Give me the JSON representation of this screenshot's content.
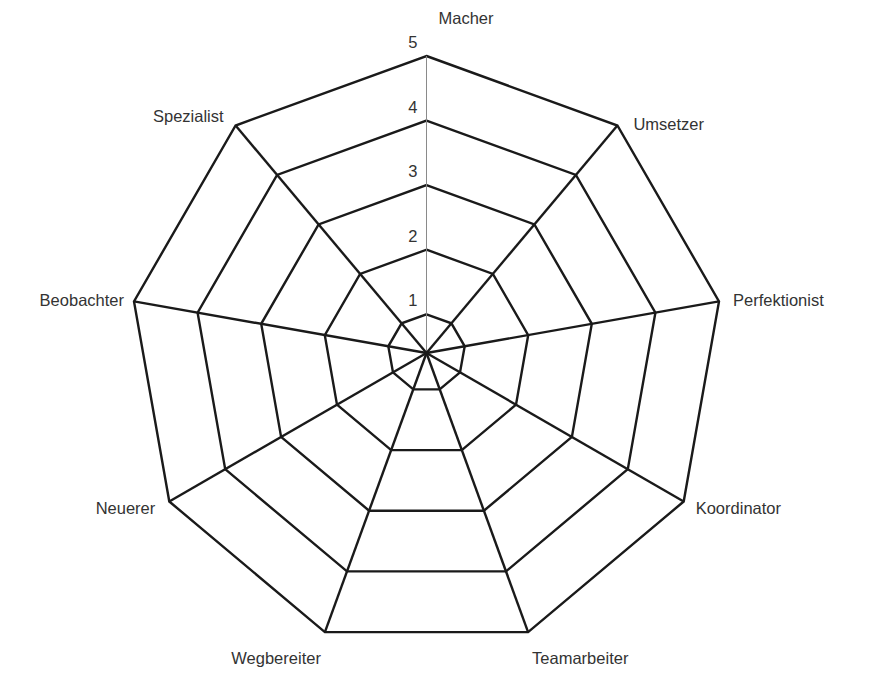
{
  "chart_data": {
    "type": "radar",
    "title": "",
    "categories": [
      "Macher",
      "Umsetzer",
      "Perfektionist",
      "Koordinator",
      "Teamarbeiter",
      "Wegbereiter",
      "Neuerer",
      "Beobachter",
      "Spezialist"
    ],
    "series": [],
    "radial_ticks": [
      "1",
      "2",
      "3",
      "4",
      "5"
    ],
    "rlim": [
      0.4,
      5
    ],
    "grid": true,
    "legend": "none",
    "colors": {
      "grid": "#1a1a1a",
      "main_axis": "#8a8a8a",
      "text": "#333333"
    }
  }
}
